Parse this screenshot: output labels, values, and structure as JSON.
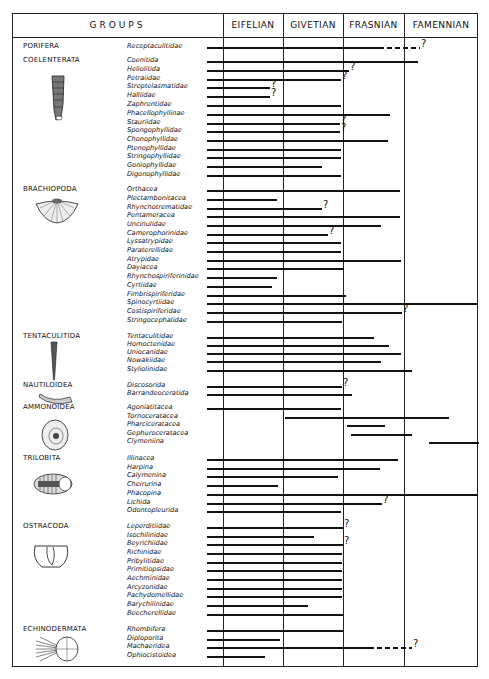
{
  "chart_data": {
    "type": "range-chart",
    "title": "",
    "columns": [
      "GROUPS",
      "EIFELIAN",
      "GIVETIAN",
      "FRASNIAN",
      "FAMENNIAN"
    ],
    "stage_boundaries_px": {
      "eifelian_start": 223,
      "givetian_start": 283,
      "frasnian_start": 343,
      "famennian_start": 404,
      "famennian_end": 478
    },
    "note": "Each taxon has a horizontal range line; start/end given as x pixel positions; dashed = uncertain extension; q = question mark at end.",
    "groups": [
      {
        "name": "PORIFERA",
        "y": 47,
        "icon": "none",
        "taxa": [
          {
            "name": "Receptaculitidae",
            "y": 47,
            "start": 207,
            "end": 384,
            "dash_end": 420,
            "q": true
          }
        ]
      },
      {
        "name": "COELENTERATA",
        "y": 61,
        "icon": "rugose-coral-icon",
        "taxa": [
          {
            "name": "Coenitida",
            "y": 61,
            "start": 207,
            "end": 418
          },
          {
            "name": "Heliolitida",
            "y": 70,
            "start": 207,
            "end": 349,
            "q": true
          },
          {
            "name": "Petraiidae",
            "y": 79,
            "start": 207,
            "end": 341,
            "q": true
          },
          {
            "name": "Streptelasmatidae",
            "y": 87,
            "start": 207,
            "end": 270,
            "q": true
          },
          {
            "name": "Halliidae",
            "y": 96,
            "start": 207,
            "end": 270,
            "q": true
          },
          {
            "name": "Zaphrentidae",
            "y": 105,
            "start": 207,
            "end": 341
          },
          {
            "name": "Phacellophyllinae",
            "y": 114,
            "start": 207,
            "end": 390
          },
          {
            "name": "Stauriidae",
            "y": 123,
            "start": 207,
            "end": 340,
            "q": true
          },
          {
            "name": "Spongophyllidae",
            "y": 131,
            "start": 207,
            "end": 340,
            "q": true
          },
          {
            "name": "Chonophyllidae",
            "y": 140,
            "start": 207,
            "end": 388
          },
          {
            "name": "Ptenophyllidae",
            "y": 149,
            "start": 207,
            "end": 341
          },
          {
            "name": "Stringophyllidae",
            "y": 157,
            "start": 207,
            "end": 341
          },
          {
            "name": "Goniophyllidae",
            "y": 166,
            "start": 207,
            "end": 322
          },
          {
            "name": "Digonophyllidae",
            "y": 175,
            "start": 207,
            "end": 341
          }
        ]
      },
      {
        "name": "BRACHIOPODA",
        "y": 190,
        "icon": "brachiopod-shell-icon",
        "taxa": [
          {
            "name": "Orthacea",
            "y": 190,
            "start": 207,
            "end": 400
          },
          {
            "name": "Plectambonitacea",
            "y": 199,
            "start": 207,
            "end": 277
          },
          {
            "name": "Rhynchotrematidae",
            "y": 208,
            "start": 207,
            "end": 322,
            "q": true
          },
          {
            "name": "Pentameracea",
            "y": 216,
            "start": 207,
            "end": 400
          },
          {
            "name": "Uncinulidae",
            "y": 225,
            "start": 207,
            "end": 381
          },
          {
            "name": "Camerophorinidae",
            "y": 234,
            "start": 207,
            "end": 328,
            "q": true
          },
          {
            "name": "Lyssatrypidae",
            "y": 242,
            "start": 207,
            "end": 341
          },
          {
            "name": "Paraterellidae",
            "y": 251,
            "start": 207,
            "end": 341
          },
          {
            "name": "Atrypidae",
            "y": 260,
            "start": 207,
            "end": 401
          },
          {
            "name": "Dayiacea",
            "y": 268,
            "start": 207,
            "end": 344
          },
          {
            "name": "Rhynchospiriferinidae",
            "y": 277,
            "start": 207,
            "end": 277
          },
          {
            "name": "Cyrtiidae",
            "y": 286,
            "start": 207,
            "end": 272
          },
          {
            "name": "Fimbrispiriferidae",
            "y": 295,
            "start": 207,
            "end": 346
          },
          {
            "name": "Spinocyrtiidae",
            "y": 303,
            "start": 207,
            "end": 477
          },
          {
            "name": "Costispiriferidae",
            "y": 312,
            "start": 207,
            "end": 402,
            "q": true
          },
          {
            "name": "Stringocephalidae",
            "y": 321,
            "start": 207,
            "end": 342
          }
        ]
      },
      {
        "name": "TENTACULITIDA",
        "y": 337,
        "icon": "tentaculite-cone-icon",
        "taxa": [
          {
            "name": "Tentaculitidae",
            "y": 337,
            "start": 207,
            "end": 374
          },
          {
            "name": "Homoctenidae",
            "y": 345,
            "start": 207,
            "end": 389
          },
          {
            "name": "Uniocanidae",
            "y": 353,
            "start": 207,
            "end": 401
          },
          {
            "name": "Nowakiidae",
            "y": 361,
            "start": 207,
            "end": 381
          },
          {
            "name": "Styliolinidae",
            "y": 370,
            "start": 207,
            "end": 412
          }
        ]
      },
      {
        "name": "NAUTILOIDEA",
        "y": 386,
        "icon": "nautiloid-shell-icon",
        "taxa": [
          {
            "name": "Discosorida",
            "y": 386,
            "start": 207,
            "end": 342,
            "q": true
          },
          {
            "name": "Barrandeoceratida",
            "y": 394,
            "start": 207,
            "end": 352
          }
        ]
      },
      {
        "name": "AMMONOIDEA",
        "y": 408,
        "icon": "ammonite-icon",
        "taxa": [
          {
            "name": "Agoniatitacea",
            "y": 408,
            "start": 207,
            "end": 341
          },
          {
            "name": "Tornoceratacea",
            "y": 417,
            "start": 285,
            "end": 449
          },
          {
            "name": "Pharciceratacea",
            "y": 425,
            "start": 347,
            "end": 385
          },
          {
            "name": "Gephuroceratacea",
            "y": 434,
            "start": 351,
            "end": 412
          },
          {
            "name": "Clymeniina",
            "y": 442,
            "start": 429,
            "end": 479
          }
        ]
      },
      {
        "name": "TRILOBITA",
        "y": 459,
        "icon": "trilobite-icon",
        "taxa": [
          {
            "name": "Illinacea",
            "y": 459,
            "start": 207,
            "end": 398
          },
          {
            "name": "Harpina",
            "y": 468,
            "start": 207,
            "end": 380
          },
          {
            "name": "Calymenina",
            "y": 476,
            "start": 207,
            "end": 338
          },
          {
            "name": "Cheirurina",
            "y": 485,
            "start": 207,
            "end": 278
          },
          {
            "name": "Phacopina",
            "y": 494,
            "start": 207,
            "end": 478
          },
          {
            "name": "Lichida",
            "y": 503,
            "start": 207,
            "end": 382,
            "q": true
          },
          {
            "name": "Odontopleurida",
            "y": 511,
            "start": 207,
            "end": 341
          }
        ]
      },
      {
        "name": "OSTRACODA",
        "y": 527,
        "icon": "ostracod-shell-icon",
        "taxa": [
          {
            "name": "Leperditiidae",
            "y": 527,
            "start": 207,
            "end": 343,
            "q": true
          },
          {
            "name": "Isochilinidae",
            "y": 536,
            "start": 207,
            "end": 314
          },
          {
            "name": "Beyrichiidae",
            "y": 544,
            "start": 207,
            "end": 343,
            "q": true
          },
          {
            "name": "Richinidae",
            "y": 553,
            "start": 207,
            "end": 342
          },
          {
            "name": "Pribylitidae",
            "y": 562,
            "start": 207,
            "end": 342
          },
          {
            "name": "Primitiopsidae",
            "y": 570,
            "start": 207,
            "end": 342
          },
          {
            "name": "Aechminidae",
            "y": 579,
            "start": 207,
            "end": 342
          },
          {
            "name": "Arcyzonidae",
            "y": 588,
            "start": 207,
            "end": 342
          },
          {
            "name": "Pachydomellidae",
            "y": 596,
            "start": 207,
            "end": 342
          },
          {
            "name": "Barychilinidae",
            "y": 605,
            "start": 207,
            "end": 308
          },
          {
            "name": "Beecherellidae",
            "y": 614,
            "start": 207,
            "end": 343
          }
        ]
      },
      {
        "name": "ECHINODERMATA",
        "y": 630,
        "icon": "echinoderm-icon",
        "taxa": [
          {
            "name": "Rhombifera",
            "y": 630,
            "start": 207,
            "end": 343
          },
          {
            "name": "Diploporita",
            "y": 639,
            "start": 207,
            "end": 280
          },
          {
            "name": "Machaeridea",
            "y": 647,
            "start": 207,
            "end": 374,
            "dash_end": 412,
            "q": true
          },
          {
            "name": "Ophiocistoidea",
            "y": 656,
            "start": 207,
            "end": 265
          }
        ]
      }
    ]
  }
}
